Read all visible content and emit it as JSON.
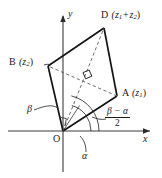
{
  "figure": {
    "axes": {
      "x_label": "x",
      "y_label": "y",
      "origin_label": "O"
    },
    "vertices": [
      {
        "id": "O",
        "label": "O",
        "x": 63,
        "y": 131
      },
      {
        "id": "A",
        "label": "A",
        "value": "(z₁)",
        "x": 117,
        "y": 96
      },
      {
        "id": "B",
        "label": "B",
        "value": "(z₂)",
        "x": 48,
        "y": 66
      },
      {
        "id": "D",
        "label": "D",
        "value": "(z₁ + z₂)",
        "x": 104,
        "y": 28
      }
    ],
    "labels": {
      "point_a": "A (z₁)",
      "point_b": "B (z₂)",
      "point_d": "D (z₁ + z₂)",
      "origin": "O",
      "x_axis": "x",
      "y_axis": "y",
      "alpha": "α",
      "beta": "β",
      "half_angle_numerator": "β − α",
      "half_angle_denominator": "2"
    },
    "angles": {
      "alpha_label": "α",
      "alpha_description": "angle from positive x-axis to OA",
      "beta_label": "β",
      "beta_description": "angle from positive x-axis to OB",
      "bisector_label": "(β − α)/2",
      "right_angle_marker": true,
      "right_angle_position": {
        "x": 88,
        "y": 74
      }
    },
    "colors": {
      "stroke": "#1a1a1a",
      "axis": "#3c3c3c",
      "dashed": "#5a5a5a",
      "background": "#ffffff"
    }
  }
}
